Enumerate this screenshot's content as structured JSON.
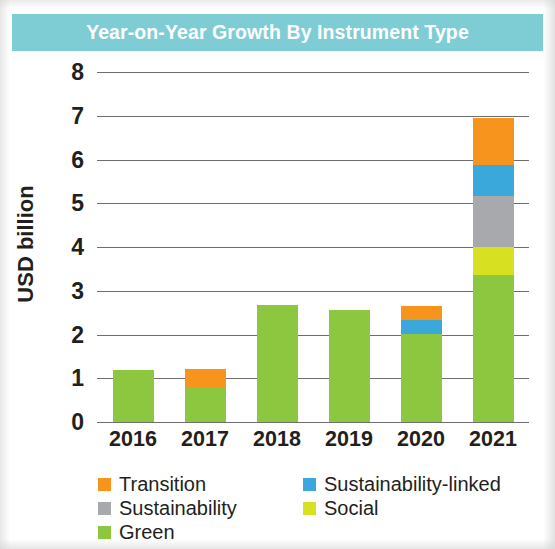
{
  "title": "Year-on-Year Growth By Instrument Type",
  "theme": {
    "title_bar_color": "#7ecdd4",
    "title_text_color": "#ffffff",
    "axis_text_color": "#231f20",
    "gridline_color": "#6d6e71"
  },
  "legend": {
    "rows": [
      [
        {
          "label": "Transition",
          "color": "#f7941e",
          "key": "transition"
        },
        {
          "label": "Sustainability-linked",
          "color": "#3ba8dc",
          "key": "sustainability_linked"
        }
      ],
      [
        {
          "label": "Sustainability",
          "color": "#a7a9ac",
          "key": "sustainability"
        },
        {
          "label": "Social",
          "color": "#d7e021",
          "key": "social"
        }
      ],
      [
        {
          "label": "Green",
          "color": "#8dc63f",
          "key": "green"
        }
      ]
    ]
  },
  "chart_data": {
    "type": "bar",
    "stacked": true,
    "title": "Year-on-Year Growth By Instrument Type",
    "xlabel": "",
    "ylabel": "USD billion",
    "ylim": [
      0,
      8
    ],
    "yticks": [
      0,
      1,
      2,
      3,
      4,
      5,
      6,
      7,
      8
    ],
    "ytick_labels": [
      "0",
      "1",
      "2",
      "3",
      "4",
      "5",
      "6",
      "7",
      "8"
    ],
    "grid": true,
    "legend_position": "bottom",
    "categories": [
      "2016",
      "2017",
      "2018",
      "2019",
      "2020",
      "2021"
    ],
    "series": [
      {
        "name": "Green",
        "color": "#8dc63f",
        "values": [
          1.2,
          0.78,
          2.67,
          2.55,
          2.01,
          3.36
        ]
      },
      {
        "name": "Social",
        "color": "#d7e021",
        "values": [
          0,
          0,
          0,
          0,
          0,
          0.64
        ]
      },
      {
        "name": "Sustainability",
        "color": "#a7a9ac",
        "values": [
          0,
          0,
          0,
          0,
          0,
          1.17
        ]
      },
      {
        "name": "Sustainability-linked",
        "color": "#3ba8dc",
        "values": [
          0,
          0,
          0,
          0,
          0.32,
          0.71
        ]
      },
      {
        "name": "Transition",
        "color": "#f7941e",
        "values": [
          0,
          0.43,
          0,
          0,
          0.32,
          1.07
        ]
      }
    ],
    "totals": [
      1.2,
      1.21,
      2.67,
      2.55,
      2.65,
      6.95
    ]
  }
}
